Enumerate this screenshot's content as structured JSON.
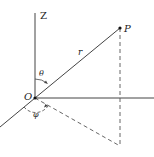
{
  "diagram": {
    "labels": {
      "z_axis": "Z",
      "origin": "O",
      "point": "P",
      "radius": "r",
      "polar_angle": "θ",
      "azimuth_angle": "φ"
    },
    "colors": {
      "line": "#333333",
      "background": "#ffffff"
    }
  }
}
